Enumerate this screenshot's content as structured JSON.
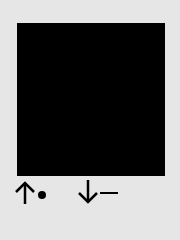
{
  "canvas": {
    "background": "#e6e6e6",
    "square_color": "#000000"
  },
  "controls": [
    {
      "icon": "up-arrow-icon",
      "marker": "dot"
    },
    {
      "icon": "down-arrow-icon",
      "marker": "dash"
    }
  ]
}
